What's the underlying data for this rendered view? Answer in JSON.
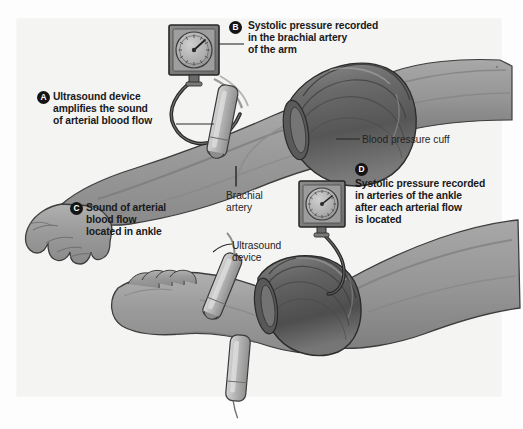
{
  "figure": {
    "background_color": "#f4f4f3",
    "ink_color": "#19191a",
    "skin_color": "#9a9a9a",
    "cuff_color": "#6e6e6e",
    "device_color": "#b9b9b9"
  },
  "callouts": [
    {
      "id": "A",
      "badge": "A",
      "text": "Ultrasound device\namplifies the sound\nof arterial blood flow",
      "style": "bold"
    },
    {
      "id": "B",
      "badge": "B",
      "text": "Systolic pressure recorded\nin the brachial artery\nof the arm",
      "style": "bold"
    },
    {
      "id": "C",
      "badge": "C",
      "text": "Sound of arterial\nblood flow\nlocated in ankle",
      "style": "bold"
    },
    {
      "id": "D",
      "badge": "D",
      "text": "Systolic pressure recorded\nin arteries of the ankle\nafter each arterial flow\nis located",
      "style": "bold"
    }
  ],
  "annotations": [
    {
      "id": "blood-pressure-cuff",
      "text": "Blood pressure cuff"
    },
    {
      "id": "brachial-artery",
      "text": "Brachial\nartery"
    },
    {
      "id": "ultrasound-device",
      "text": "Ultrasound\ndevice"
    }
  ],
  "devices": {
    "gauge_arm": "sphygmomanometer-gauge",
    "gauge_ankle": "sphygmomanometer-gauge",
    "probe_arm": "ultrasound-probe",
    "probe_ankle_upper": "ultrasound-probe",
    "probe_ankle_lower": "ultrasound-probe",
    "cuff_arm": "blood-pressure-cuff",
    "cuff_ankle": "blood-pressure-cuff"
  },
  "anatomy": {
    "arm": "patient-arm-with-hand",
    "leg": "patient-leg-with-foot"
  }
}
